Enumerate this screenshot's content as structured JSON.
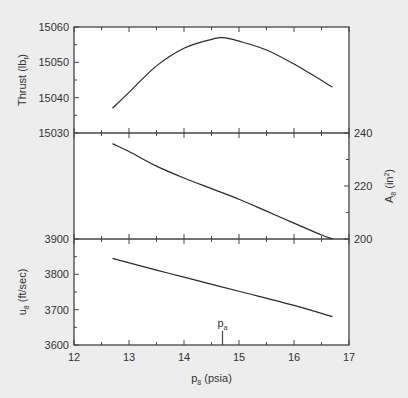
{
  "chart_data": [
    {
      "type": "line",
      "panel": "top",
      "title": "",
      "xlabel": "p8 (psia)",
      "ylabel": "Thrust (lbf)",
      "ylabel_main": "Thrust (lb",
      "ylabel_sub": "f",
      "ylabel_close": ")",
      "y_axis_side": "left",
      "ylim": [
        15030,
        15060
      ],
      "yticks": [
        15030,
        15040,
        15050,
        15060
      ],
      "series": [
        {
          "name": "Thrust",
          "x": [
            12.7,
            13.0,
            13.5,
            14.0,
            14.5,
            14.7,
            15.0,
            15.5,
            16.0,
            16.7
          ],
          "y": [
            15037,
            15041.5,
            15049,
            15054,
            15056.5,
            15057,
            15056,
            15053.5,
            15049.5,
            15043
          ]
        }
      ]
    },
    {
      "type": "line",
      "panel": "middle",
      "ylabel": "A8 (in2)",
      "ylabel_main": "A",
      "ylabel_sub": "8",
      "ylabel_rest": " (in",
      "ylabel_sup": "2",
      "ylabel_close": ")",
      "y_axis_side": "right",
      "ylim": [
        200,
        240
      ],
      "yticks": [
        200,
        220,
        240
      ],
      "series": [
        {
          "name": "A8",
          "x": [
            12.7,
            13.0,
            13.5,
            14.0,
            14.5,
            15.0,
            15.5,
            16.0,
            16.5,
            16.7
          ],
          "y": [
            236,
            233,
            227.5,
            223,
            219,
            215,
            210.5,
            206,
            201.5,
            200
          ]
        }
      ]
    },
    {
      "type": "line",
      "panel": "bottom",
      "ylabel": "u8 (ft/sec)",
      "ylabel_main": "u",
      "ylabel_sub": "8",
      "ylabel_rest": " (ft/sec)",
      "y_axis_side": "left",
      "ylim": [
        3600,
        3900
      ],
      "yticks": [
        3600,
        3700,
        3800,
        3900
      ],
      "series": [
        {
          "name": "u8",
          "x": [
            12.7,
            13.5,
            14.0,
            15.0,
            16.0,
            16.7
          ],
          "y": [
            3845,
            3812,
            3792,
            3752,
            3712,
            3680
          ]
        }
      ],
      "annotations": [
        {
          "text": "pa",
          "main": "p",
          "sub": "a",
          "x": 14.7,
          "note": "ambient pressure marker"
        }
      ]
    }
  ],
  "x_axis": {
    "label_main": "p",
    "label_sub": "8",
    "label_rest": " (psia)",
    "xlim": [
      12,
      17
    ],
    "xticks": [
      12,
      13,
      14,
      15,
      16,
      17
    ],
    "minor_step": 0.5
  },
  "colors": {
    "background": "#ededed",
    "plot_area": "#ffffff",
    "line": "#2a2a2a",
    "axis": "#444444",
    "text": "#333333"
  }
}
